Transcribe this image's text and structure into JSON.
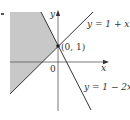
{
  "figure": {
    "type": "inequality-region-graph",
    "colors": {
      "background": "#ffffff",
      "shaded_region": "#c8c8c8",
      "lines": "#333333",
      "axes": "#555555",
      "text": "#333333"
    },
    "axes": {
      "x_label": "x",
      "y_label": "y",
      "origin_label": "0"
    },
    "lines": [
      {
        "id": "line-1",
        "equation": "y = 1 + x",
        "label": "y = 1 + x"
      },
      {
        "id": "line-2",
        "equation": "y = 1 − 2x",
        "label": "y = 1 − 2x"
      }
    ],
    "intersection": {
      "label": "(0, 1)",
      "x": 0,
      "y": 1
    },
    "shaded_region_description": "region left of both lines: y ≥ 1 + x and y ≥ 1 − 2x"
  }
}
